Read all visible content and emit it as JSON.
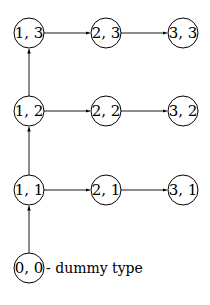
{
  "diagram": {
    "nodes": [
      {
        "id": "1,3",
        "label": "1, 3",
        "cx": 29,
        "cy": 33
      },
      {
        "id": "2,3",
        "label": "2, 3",
        "cx": 106,
        "cy": 33
      },
      {
        "id": "3,3",
        "label": "3, 3",
        "cx": 183,
        "cy": 33
      },
      {
        "id": "1,2",
        "label": "1, 2",
        "cx": 29,
        "cy": 111
      },
      {
        "id": "2,2",
        "label": "2, 2",
        "cx": 106,
        "cy": 111
      },
      {
        "id": "3,2",
        "label": "3, 2",
        "cx": 183,
        "cy": 111
      },
      {
        "id": "1,1",
        "label": "1, 1",
        "cx": 29,
        "cy": 190
      },
      {
        "id": "2,1",
        "label": "2, 1",
        "cx": 106,
        "cy": 190
      },
      {
        "id": "3,1",
        "label": "3, 1",
        "cx": 183,
        "cy": 190
      },
      {
        "id": "0,0",
        "label": "0, 0",
        "cx": 29,
        "cy": 268
      }
    ],
    "edges": [
      {
        "from": "1,3",
        "to": "2,3"
      },
      {
        "from": "2,3",
        "to": "3,3"
      },
      {
        "from": "1,2",
        "to": "2,2"
      },
      {
        "from": "2,2",
        "to": "3,2"
      },
      {
        "from": "1,1",
        "to": "2,1"
      },
      {
        "from": "2,1",
        "to": "3,1"
      },
      {
        "from": "1,2",
        "to": "1,3"
      },
      {
        "from": "1,1",
        "to": "1,2"
      },
      {
        "from": "0,0",
        "to": "1,1"
      }
    ],
    "annotation": {
      "text": "- dummy type",
      "x": 46,
      "y": 273
    }
  }
}
